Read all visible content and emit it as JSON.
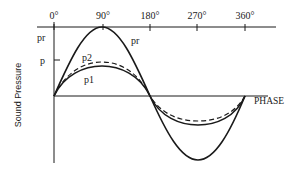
{
  "diagram": {
    "type": "sinusoid-phase-diagram",
    "y_axis_label": "Sound Pressure",
    "x_axis_label": "PHASE",
    "phase_ticks": [
      "0°",
      "90°",
      "180°",
      "270°",
      "360°"
    ],
    "y_labels": {
      "pr_axis": "pr",
      "p_axis": "p"
    },
    "curve_labels": {
      "pr": "pr",
      "p2": "p2",
      "p1": "p1"
    },
    "curves": [
      {
        "name": "pr",
        "style": "solid",
        "relative_amplitude": 1.0
      },
      {
        "name": "p2",
        "style": "dashed",
        "relative_amplitude": 0.5
      },
      {
        "name": "p1",
        "style": "solid",
        "relative_amplitude": 0.44
      }
    ]
  }
}
